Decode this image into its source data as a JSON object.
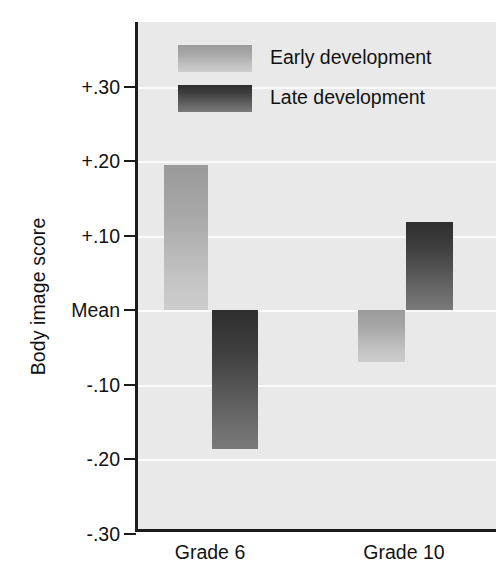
{
  "chart_data": {
    "type": "bar",
    "title": "",
    "xlabel": "",
    "ylabel": "Body image score",
    "categories": [
      "Grade 6",
      "Grade 10"
    ],
    "series": [
      {
        "name": "Early development",
        "values": [
          0.195,
          -0.07
        ],
        "color": "#b0b0b0"
      },
      {
        "name": "Late development",
        "values": [
          -0.186,
          0.118
        ],
        "color": "#4a4a4a"
      }
    ],
    "ylim": [
      -0.3,
      0.35
    ],
    "yticks": [
      0.3,
      0.2,
      0.1,
      0.0,
      -0.1,
      -0.2,
      -0.3
    ],
    "ytick_labels": [
      "+.30",
      "+.20",
      "+.10",
      "Mean",
      "-.10",
      "-.20",
      "-.30"
    ],
    "grid": true,
    "legend_position": "top-left-inside",
    "baseline_label": "Mean",
    "plot_background": "#e9e9e9",
    "gridline_color": "#fafafa",
    "axis_color": "#1b1b1b"
  },
  "axis": {
    "y_title": "Body image score",
    "ticks": [
      {
        "label": "+.30",
        "value": 0.3
      },
      {
        "label": "+.20",
        "value": 0.2
      },
      {
        "label": "+.10",
        "value": 0.1
      },
      {
        "label": "Mean",
        "value": 0.0
      },
      {
        "label": "-.10",
        "value": -0.1
      },
      {
        "label": "-.20",
        "value": -0.2
      },
      {
        "label": "-.30",
        "value": -0.3
      }
    ]
  },
  "legend": {
    "items": [
      {
        "label": "Early development",
        "swatch": "early"
      },
      {
        "label": "Late development",
        "swatch": "late"
      }
    ]
  },
  "x_categories": [
    {
      "label": "Grade 6"
    },
    {
      "label": "Grade 10"
    }
  ],
  "bars": [
    {
      "group": "Grade 6",
      "series": "Early development",
      "value": 0.195,
      "style": "early"
    },
    {
      "group": "Grade 6",
      "series": "Late development",
      "value": -0.186,
      "style": "late"
    },
    {
      "group": "Grade 10",
      "series": "Early development",
      "value": -0.07,
      "style": "early"
    },
    {
      "group": "Grade 10",
      "series": "Late development",
      "value": 0.118,
      "style": "late"
    }
  ]
}
